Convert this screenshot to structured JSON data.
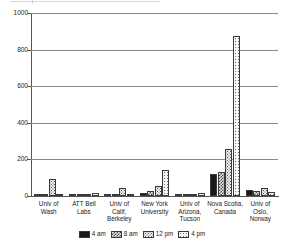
{
  "chart_data": {
    "type": "bar",
    "title": "",
    "xlabel": "",
    "ylabel": "",
    "ylim": [
      0,
      1000
    ],
    "yticks": [
      0,
      200,
      400,
      600,
      800,
      1000
    ],
    "grid": true,
    "legend_position": "bottom",
    "categories": [
      "Univ of Wash",
      "ATT Bell Labs",
      "Univ of Calif, Berkeley",
      "New York University",
      "Univ of Arizona, Tucson",
      "Nova Scotia, Canada",
      "Univ of Oslo, Norway"
    ],
    "category_lines": [
      [
        "Univ of",
        "Wash"
      ],
      [
        "ATT Bell",
        "Labs"
      ],
      [
        "Univ of",
        "Calif,",
        "Berkeley"
      ],
      [
        "New York",
        "University"
      ],
      [
        "Univ of",
        "Arizona,",
        "Tucson"
      ],
      [
        "Nova Scotia,",
        "Canada"
      ],
      [
        "Univ of",
        "Oslo,",
        "Norway"
      ]
    ],
    "series": [
      {
        "name": "4 am",
        "pattern": "solid-black",
        "values": [
          4,
          8,
          5,
          18,
          4,
          120,
          33
        ]
      },
      {
        "name": "8 am",
        "pattern": "dense-check",
        "values": [
          3,
          10,
          4,
          25,
          3,
          130,
          28
        ]
      },
      {
        "name": "12 pm",
        "pattern": "medium-dots",
        "values": [
          92,
          12,
          46,
          57,
          12,
          255,
          45
        ]
      },
      {
        "name": "4 pm",
        "pattern": "light-dots",
        "values": [
          3,
          16,
          5,
          143,
          19,
          877,
          22
        ]
      }
    ]
  },
  "legend": {
    "items": [
      "4 am",
      "8 am",
      "12 pm",
      "4 pm"
    ]
  },
  "colors": {
    "axis": "#555555",
    "grid": "#8a8a8a",
    "series_4am": "#1a1a1a",
    "background": "#ffffff"
  }
}
